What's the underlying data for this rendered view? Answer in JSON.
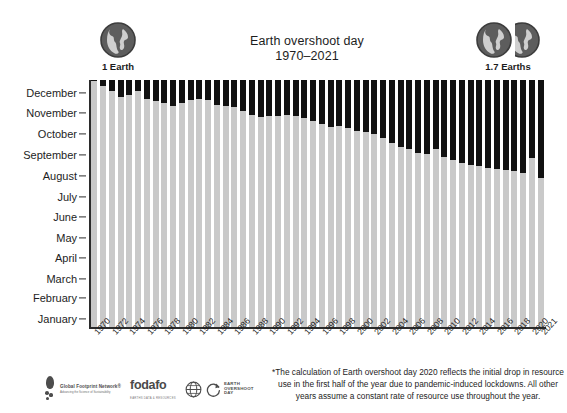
{
  "chart_data": {
    "type": "bar",
    "title": "Earth overshoot day",
    "subtitle": "1970–2021",
    "xlabel": "",
    "ylabel": "",
    "grid": false,
    "legend_position": "none",
    "note": "Stacked bar: light gray portion = part of year supported by Earth's biocapacity (ends on Earth Overshoot Day); black portion = remainder of year in ecological overshoot.",
    "y_axis": {
      "type": "month-of-year",
      "direction": "bottom-to-top",
      "tick_labels": [
        "January",
        "February",
        "March",
        "April",
        "May",
        "June",
        "July",
        "August",
        "September",
        "October",
        "November",
        "December"
      ],
      "range": [
        "January 1",
        "December 31"
      ]
    },
    "x_tick_labels": [
      "1970",
      "1972",
      "1974",
      "1976",
      "1978",
      "1980",
      "1982",
      "1984",
      "1986",
      "1988",
      "1990",
      "1992",
      "1994",
      "1996",
      "1998",
      "2000",
      "2002",
      "2004",
      "2006",
      "2008",
      "2010",
      "2012",
      "2014",
      "2016",
      "2018",
      "2020",
      "2021"
    ],
    "categories": [
      "1970",
      "1971",
      "1972",
      "1973",
      "1974",
      "1975",
      "1976",
      "1977",
      "1978",
      "1979",
      "1980",
      "1981",
      "1982",
      "1983",
      "1984",
      "1985",
      "1986",
      "1987",
      "1988",
      "1989",
      "1990",
      "1991",
      "1992",
      "1993",
      "1994",
      "1995",
      "1996",
      "1997",
      "1998",
      "1999",
      "2000",
      "2001",
      "2002",
      "2003",
      "2004",
      "2005",
      "2006",
      "2007",
      "2008",
      "2009",
      "2010",
      "2011",
      "2012",
      "2013",
      "2014",
      "2015",
      "2016",
      "2017",
      "2018",
      "2019",
      "2020",
      "2021"
    ],
    "series": [
      {
        "name": "Earth overshoot day (day of year, fraction of year supported by biocapacity)",
        "unit": "fraction of year",
        "values": [
          0.995,
          0.975,
          0.955,
          0.93,
          0.94,
          0.955,
          0.925,
          0.915,
          0.905,
          0.895,
          0.905,
          0.92,
          0.925,
          0.92,
          0.9,
          0.895,
          0.89,
          0.875,
          0.86,
          0.85,
          0.855,
          0.855,
          0.86,
          0.855,
          0.845,
          0.835,
          0.82,
          0.81,
          0.815,
          0.805,
          0.795,
          0.79,
          0.78,
          0.765,
          0.745,
          0.73,
          0.72,
          0.705,
          0.7,
          0.72,
          0.69,
          0.675,
          0.665,
          0.655,
          0.65,
          0.645,
          0.64,
          0.635,
          0.63,
          0.625,
          0.685,
          0.605
        ]
      }
    ],
    "overshoot_markers": {
      "one_earth_label": "1 Earth",
      "one_earth_year": "1970",
      "current_label": "1.7 Earths",
      "current_year": "2021",
      "earths_value": 1.7
    },
    "colors": {
      "biocapacity_gray": "#c9c9c9",
      "overshoot_black": "#111111",
      "axis": "#2b2b2b",
      "text": "#1d1d1d",
      "background": "#ffffff"
    }
  },
  "footnote": "*The calculation of Earth overshoot day 2020 reflects the initial drop in resource use in the first half of the year due to pandemic-induced lockdowns. All other years assume a constant rate of resource use throughout the year.",
  "logos": [
    {
      "id": "global-footprint-network",
      "name": "Global Footprint Network®",
      "tagline": "Advancing the Science of Sustainability"
    },
    {
      "id": "fodafo",
      "name": "fodafo",
      "tagline": "EARTHS DATA & RESOURCES"
    },
    {
      "id": "earth-overshoot-day",
      "line1": "EARTH",
      "line2": "OVERSHOOT",
      "line3": "DAY"
    }
  ]
}
